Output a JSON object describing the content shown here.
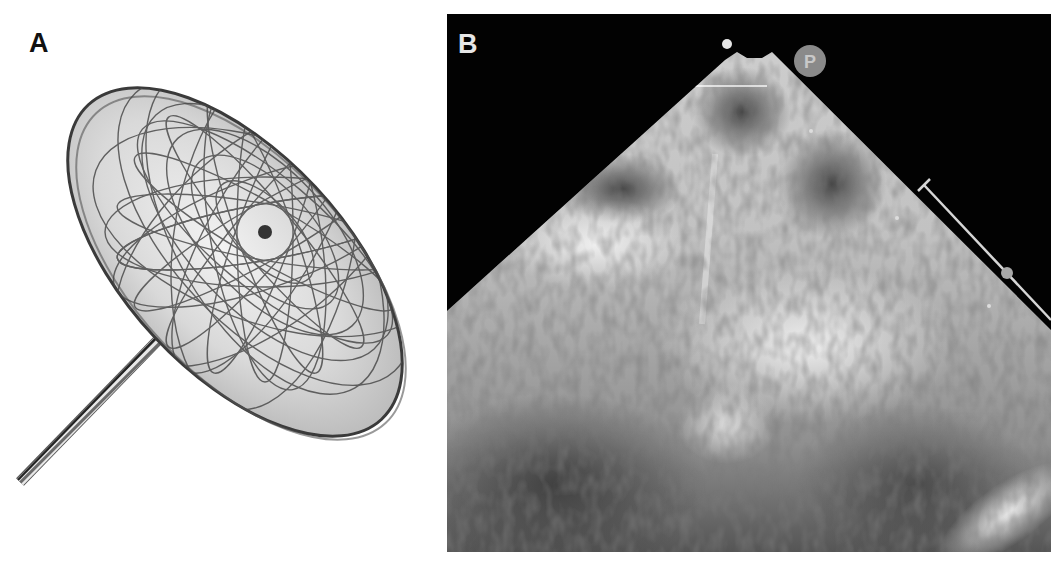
{
  "figure": {
    "panels": [
      {
        "label": "A",
        "content": "occluder device with wire mesh disc and delivery cable"
      },
      {
        "label": "B",
        "content": "echocardiography ultrasound sector image",
        "orientation_marker": "P"
      }
    ]
  },
  "colors": {
    "background": "#ffffff",
    "panel_b_background": "#020202",
    "mesh_wire": "#4a4a4a",
    "disc_fill": "#d8d8d8",
    "ultrasound_tissue": "#bdbdbd",
    "label_a": "#111111",
    "label_b": "#e6e6e6"
  }
}
